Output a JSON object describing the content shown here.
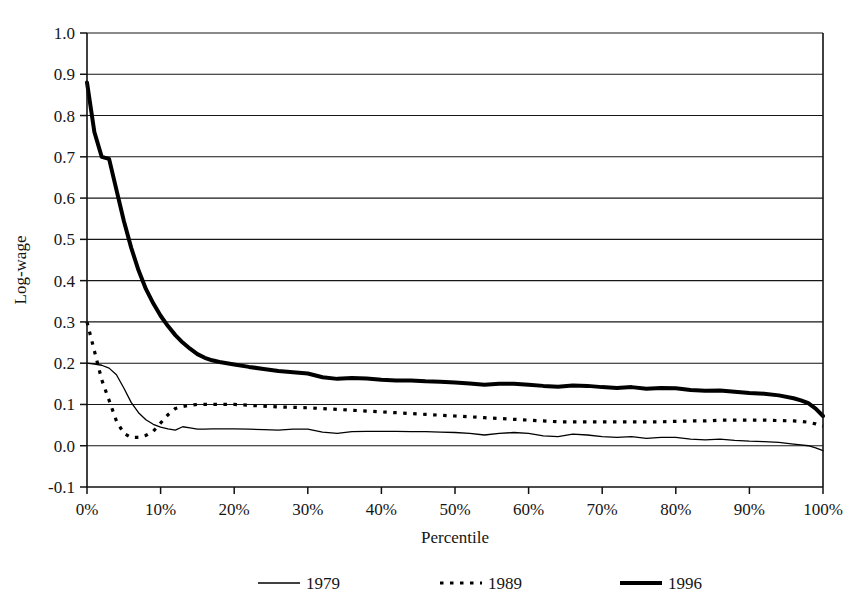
{
  "chart_data": {
    "type": "line",
    "title": "",
    "xlabel": "Percentile",
    "ylabel": "Log-wage",
    "xlim": [
      0,
      100
    ],
    "ylim": [
      -0.1,
      1.0
    ],
    "grid": true,
    "legend_position": "bottom",
    "x_tick_labels": [
      "0%",
      "10%",
      "20%",
      "30%",
      "40%",
      "50%",
      "60%",
      "70%",
      "80%",
      "90%",
      "100%"
    ],
    "x_ticks": [
      0,
      10,
      20,
      30,
      40,
      50,
      60,
      70,
      80,
      90,
      100
    ],
    "y_tick_labels": [
      "1.0",
      "0.9",
      "0.8",
      "0.7",
      "0.6",
      "0.5",
      "0.4",
      "0.3",
      "0.2",
      "0.1",
      "0.0",
      "-0.1"
    ],
    "y_ticks": [
      1.0,
      0.9,
      0.8,
      0.7,
      0.6,
      0.5,
      0.4,
      0.3,
      0.2,
      0.1,
      0.0,
      -0.1
    ],
    "x": [
      0,
      1,
      2,
      3,
      4,
      5,
      6,
      7,
      8,
      9,
      10,
      11,
      12,
      13,
      14,
      15,
      16,
      17,
      18,
      19,
      20,
      22,
      24,
      26,
      28,
      30,
      32,
      34,
      36,
      38,
      40,
      42,
      44,
      46,
      48,
      50,
      52,
      54,
      56,
      58,
      60,
      62,
      64,
      66,
      68,
      70,
      72,
      74,
      76,
      78,
      80,
      82,
      84,
      86,
      88,
      90,
      92,
      94,
      96,
      97,
      98,
      99,
      100
    ],
    "series": [
      {
        "name": "1979",
        "style": "thin-solid",
        "color": "#000000",
        "values": [
          0.2,
          0.198,
          0.195,
          0.188,
          0.172,
          0.14,
          0.105,
          0.08,
          0.063,
          0.052,
          0.045,
          0.041,
          0.038,
          0.046,
          0.043,
          0.04,
          0.04,
          0.041,
          0.041,
          0.041,
          0.041,
          0.04,
          0.039,
          0.038,
          0.04,
          0.04,
          0.033,
          0.03,
          0.034,
          0.035,
          0.035,
          0.035,
          0.034,
          0.034,
          0.033,
          0.032,
          0.03,
          0.026,
          0.03,
          0.032,
          0.03,
          0.024,
          0.022,
          0.028,
          0.026,
          0.022,
          0.02,
          0.022,
          0.018,
          0.02,
          0.02,
          0.016,
          0.014,
          0.016,
          0.013,
          0.011,
          0.01,
          0.008,
          0.004,
          0.002,
          0.0,
          -0.005,
          -0.012
        ]
      },
      {
        "name": "1989",
        "style": "dotted",
        "color": "#000000",
        "values": [
          0.3,
          0.23,
          0.16,
          0.11,
          0.06,
          0.03,
          0.02,
          0.02,
          0.025,
          0.035,
          0.055,
          0.075,
          0.09,
          0.095,
          0.098,
          0.1,
          0.1,
          0.1,
          0.1,
          0.1,
          0.1,
          0.098,
          0.096,
          0.094,
          0.093,
          0.092,
          0.09,
          0.088,
          0.086,
          0.084,
          0.082,
          0.08,
          0.078,
          0.076,
          0.074,
          0.072,
          0.07,
          0.068,
          0.066,
          0.064,
          0.062,
          0.06,
          0.058,
          0.058,
          0.058,
          0.058,
          0.058,
          0.058,
          0.058,
          0.058,
          0.059,
          0.06,
          0.06,
          0.062,
          0.062,
          0.062,
          0.062,
          0.061,
          0.06,
          0.059,
          0.057,
          0.053,
          0.047
        ]
      },
      {
        "name": "1996",
        "style": "thick-solid",
        "color": "#000000",
        "values": [
          0.88,
          0.76,
          0.7,
          0.695,
          0.62,
          0.545,
          0.48,
          0.425,
          0.38,
          0.345,
          0.315,
          0.29,
          0.268,
          0.25,
          0.235,
          0.222,
          0.213,
          0.207,
          0.203,
          0.2,
          0.197,
          0.191,
          0.186,
          0.181,
          0.178,
          0.175,
          0.166,
          0.162,
          0.164,
          0.163,
          0.16,
          0.158,
          0.158,
          0.156,
          0.155,
          0.153,
          0.151,
          0.148,
          0.15,
          0.15,
          0.148,
          0.145,
          0.143,
          0.146,
          0.145,
          0.142,
          0.14,
          0.142,
          0.138,
          0.14,
          0.139,
          0.135,
          0.133,
          0.134,
          0.131,
          0.128,
          0.126,
          0.122,
          0.115,
          0.11,
          0.103,
          0.09,
          0.072
        ]
      }
    ]
  },
  "legend": {
    "entries": [
      {
        "label": "1979",
        "style": "thin-solid"
      },
      {
        "label": "1989",
        "style": "dotted"
      },
      {
        "label": "1996",
        "style": "thick-solid"
      }
    ]
  }
}
